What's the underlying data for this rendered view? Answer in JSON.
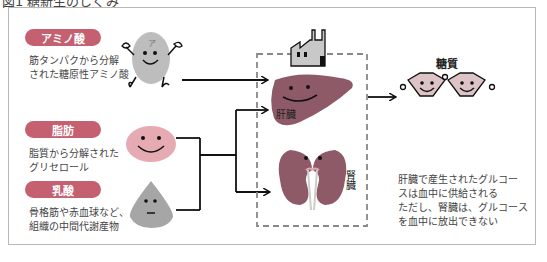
{
  "caption": "図1 糖新生のしくみ",
  "sources": [
    {
      "label": "アミノ酸",
      "desc_line1": "筋タンパクから分解",
      "desc_line2": "された糖原性アミノ酸"
    },
    {
      "label": "脂肪",
      "desc_line1": "脂質から分解された",
      "desc_line2": "グリセロール"
    },
    {
      "label": "乳酸",
      "desc_line1": "骨格筋や赤血球など、",
      "desc_line2": "組織の中間代謝産物"
    }
  ],
  "organs": {
    "liver": "肝臓",
    "kidney": "腎臓"
  },
  "product": {
    "label": "糖質"
  },
  "note": {
    "line1": "肝臓で産生されたグルコー",
    "line2": "スは血中に供給される",
    "line3": "ただし、腎臓は、グルコース",
    "line4": "を血中に放出できない"
  },
  "colors": {
    "pill": "#c4606f",
    "organ": "#8e5a68",
    "fat": "#e6aab2",
    "sugar": "#dcc3c6",
    "gray": "#a9a9a9"
  }
}
